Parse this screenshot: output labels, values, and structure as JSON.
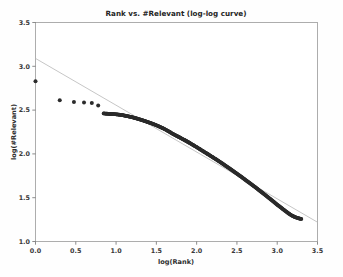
{
  "figure": {
    "background_color": "#fefefe",
    "plot_background_color": "#ffffff",
    "frame_color": "#9a9a9a"
  },
  "chart_data": {
    "type": "scatter",
    "title": "Rank vs. #Relevant (log-log curve)",
    "xlabel": "log(Rank)",
    "ylabel": "log(#Relevant)",
    "xlim": [
      0.0,
      3.5
    ],
    "ylim": [
      1.0,
      3.5
    ],
    "xticks": [
      0.0,
      0.5,
      1.0,
      1.5,
      2.0,
      2.5,
      3.0,
      3.5
    ],
    "xticklabels": [
      "0.0",
      "0.5",
      "1.0",
      "1.5",
      "2.0",
      "2.5",
      "3.0",
      "3.5"
    ],
    "yticks": [
      1.0,
      1.5,
      2.0,
      2.5,
      3.0,
      3.5
    ],
    "yticklabels": [
      "1.0",
      "1.5",
      "2.0",
      "2.5",
      "3.0",
      "3.5"
    ],
    "grid": false,
    "legend": null,
    "marker_color": "#2b2b2b",
    "marker_size": 2.0,
    "series": [
      {
        "name": "observed",
        "type": "scatter",
        "color": "#2b2b2b",
        "points": [
          [
            0.0,
            2.83
          ],
          [
            0.301,
            2.612
          ],
          [
            0.477,
            2.592
          ],
          [
            0.602,
            2.586
          ],
          [
            0.699,
            2.58
          ],
          [
            0.778,
            2.553
          ],
          [
            0.845,
            2.462
          ],
          [
            0.903,
            2.458
          ],
          [
            0.954,
            2.455
          ],
          [
            1.0,
            2.452
          ],
          [
            1.041,
            2.448
          ],
          [
            1.079,
            2.443
          ],
          [
            1.114,
            2.436
          ],
          [
            1.146,
            2.43
          ],
          [
            1.176,
            2.424
          ],
          [
            1.204,
            2.418
          ],
          [
            1.255,
            2.405
          ],
          [
            1.301,
            2.392
          ],
          [
            1.342,
            2.38
          ],
          [
            1.38,
            2.368
          ],
          [
            1.431,
            2.352
          ],
          [
            1.477,
            2.336
          ],
          [
            1.519,
            2.32
          ],
          [
            1.556,
            2.304
          ],
          [
            1.602,
            2.284
          ],
          [
            1.653,
            2.258
          ],
          [
            1.699,
            2.232
          ],
          [
            1.74,
            2.212
          ],
          [
            1.778,
            2.194
          ],
          [
            1.826,
            2.17
          ],
          [
            1.875,
            2.146
          ],
          [
            1.919,
            2.122
          ],
          [
            1.959,
            2.1
          ],
          [
            2.0,
            2.078
          ],
          [
            2.041,
            2.054
          ],
          [
            2.079,
            2.032
          ],
          [
            2.114,
            2.012
          ],
          [
            2.146,
            1.994
          ],
          [
            2.176,
            1.976
          ],
          [
            2.204,
            1.96
          ],
          [
            2.255,
            1.93
          ],
          [
            2.301,
            1.902
          ],
          [
            2.342,
            1.876
          ],
          [
            2.38,
            1.852
          ],
          [
            2.431,
            1.82
          ],
          [
            2.477,
            1.79
          ],
          [
            2.519,
            1.762
          ],
          [
            2.556,
            1.738
          ],
          [
            2.602,
            1.706
          ],
          [
            2.653,
            1.672
          ],
          [
            2.699,
            1.64
          ],
          [
            2.74,
            1.612
          ],
          [
            2.778,
            1.584
          ],
          [
            2.826,
            1.55
          ],
          [
            2.875,
            1.514
          ],
          [
            2.919,
            1.482
          ],
          [
            2.959,
            1.452
          ],
          [
            3.0,
            1.42
          ],
          [
            3.041,
            1.392
          ],
          [
            3.079,
            1.364
          ],
          [
            3.114,
            1.34
          ],
          [
            3.146,
            1.318
          ],
          [
            3.176,
            1.3
          ],
          [
            3.204,
            1.286
          ],
          [
            3.23,
            1.276
          ],
          [
            3.255,
            1.268
          ],
          [
            3.279,
            1.262
          ],
          [
            3.3,
            1.258
          ]
        ]
      },
      {
        "name": "fit-line",
        "type": "line",
        "color": "#b3b3b3",
        "endpoints": [
          [
            0.0,
            3.09
          ],
          [
            3.5,
            1.22
          ]
        ],
        "slope": -0.5343,
        "intercept": 3.09
      }
    ]
  }
}
